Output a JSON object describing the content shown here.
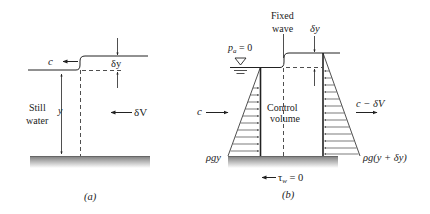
{
  "panel_a": {
    "caption": "(a)",
    "wave_speed_label": "c",
    "wave_height_label": "δy",
    "still_water_label_line1": "Still",
    "still_water_label_line2": "water",
    "depth_label": "y",
    "velocity_change_label": "δV"
  },
  "panel_b": {
    "caption": "(b)",
    "fixed_wave_line1": "Fixed",
    "fixed_wave_line2": "wave",
    "wave_height_label": "δy",
    "atmospheric_pressure_label": "p",
    "atmospheric_pressure_sub": "a",
    "atmospheric_pressure_value": " = 0",
    "inflow_label": "c",
    "outflow_label": "c − δV",
    "control_volume_line1": "Control",
    "control_volume_line2": "volume",
    "left_pressure_label": "ρgy",
    "right_pressure_label": "ρg(y + δy)",
    "wall_shear_label": "τ",
    "wall_shear_sub": "w",
    "wall_shear_value": " = 0"
  },
  "colors": {
    "line": "#222222",
    "ground_top": "#777777",
    "ground_bottom": "#ffffff"
  }
}
